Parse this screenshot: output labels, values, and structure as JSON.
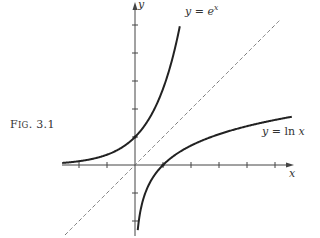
{
  "figure": {
    "label_prefix": "F",
    "label_smallcaps": "IG",
    "label_number": ". 3.1"
  },
  "chart_data": {
    "type": "line",
    "title": "Fig. 3.1",
    "xlabel": "x",
    "ylabel": "y",
    "xlim": [
      -2.6,
      5.7
    ],
    "ylim": [
      -2.5,
      5.8
    ],
    "grid": false,
    "ticks_x": [
      -2,
      -1,
      0,
      1,
      2,
      3,
      4,
      5
    ],
    "ticks_y": [
      -2,
      -1,
      0,
      1,
      2,
      3,
      4,
      5
    ],
    "tick_labels_shown": false,
    "series": [
      {
        "name": "y = e^x",
        "style": "solid",
        "function": "exp(x)",
        "x_range": [
          -2.6,
          1.6
        ]
      },
      {
        "name": "y = ln x",
        "style": "solid",
        "function": "ln(x)",
        "x_range": [
          0.07,
          5.6
        ]
      },
      {
        "name": "y = x",
        "style": "dashed",
        "function": "x",
        "x_range": [
          -2.5,
          5.2
        ]
      }
    ],
    "annotations": [
      {
        "text": "y = e^x",
        "near": "top of exp curve"
      },
      {
        "text": "y = ln x",
        "near": "right end of log curve"
      }
    ]
  },
  "labels": {
    "exp_y": "y",
    "exp_eq": "=",
    "exp_base": "e",
    "exp_sup": "x",
    "ln_y": "y",
    "ln_eq": "=",
    "ln_fn": "ln",
    "ln_x": "x",
    "x_axis": "x",
    "y_axis": "y"
  },
  "layout": {
    "origin_px": [
      135,
      165
    ],
    "unit_px": 28
  }
}
